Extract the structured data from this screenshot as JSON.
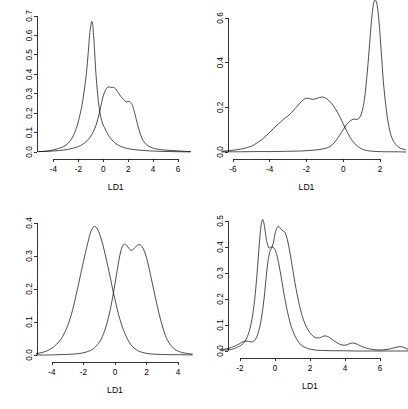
{
  "figure": {
    "title": "",
    "layout": "2x2 grid of kernel density plots",
    "background_color": "#ffffff",
    "line_color": "#000000"
  },
  "chart_data": [
    {
      "type": "line",
      "panel": "top-left",
      "title": "",
      "xlabel": "LD1",
      "ylabel": "",
      "xlim": [
        -5.2,
        7.0
      ],
      "ylim": [
        0.0,
        0.72
      ],
      "xticks": [
        -4,
        -2,
        0,
        2,
        4,
        6
      ],
      "xtick_labels": [
        "-4",
        "-2",
        "0",
        "2",
        "4",
        "6"
      ],
      "yticks": [
        0.0,
        0.1,
        0.2,
        0.3,
        0.4,
        0.5,
        0.6,
        0.7
      ],
      "ytick_labels": [
        "0.0",
        "0.1",
        "0.2",
        "0.3",
        "0.4",
        "0.5",
        "0.6",
        "0.7"
      ],
      "grid": false,
      "legend": "none",
      "series": [
        {
          "name": "group-1-narrow-peak",
          "x": [
            -5.2,
            -4.6,
            -4.2,
            -3.8,
            -3.4,
            -3.0,
            -2.7,
            -2.4,
            -2.1,
            -1.9,
            -1.7,
            -1.5,
            -1.35,
            -1.2,
            -1.1,
            -1.0,
            -0.92,
            -0.85,
            -0.78,
            -0.7,
            -0.6,
            -0.5,
            -0.4,
            -0.3,
            -0.2,
            -0.05,
            0.1,
            0.3,
            0.5,
            0.8,
            1.2,
            1.7,
            2.2,
            2.8,
            3.4,
            4.0,
            4.8,
            5.6,
            6.4,
            7.0
          ],
          "y": [
            0.002,
            0.004,
            0.008,
            0.014,
            0.022,
            0.035,
            0.055,
            0.085,
            0.135,
            0.185,
            0.245,
            0.33,
            0.41,
            0.52,
            0.6,
            0.655,
            0.672,
            0.655,
            0.6,
            0.52,
            0.41,
            0.33,
            0.265,
            0.215,
            0.18,
            0.145,
            0.125,
            0.1,
            0.078,
            0.055,
            0.035,
            0.022,
            0.015,
            0.01,
            0.007,
            0.005,
            0.003,
            0.002,
            0.001,
            0.001
          ]
        },
        {
          "name": "group-2-broad-peak",
          "x": [
            -5.2,
            -4.4,
            -3.8,
            -3.2,
            -2.8,
            -2.4,
            -2.0,
            -1.7,
            -1.4,
            -1.2,
            -1.0,
            -0.8,
            -0.6,
            -0.45,
            -0.3,
            -0.15,
            0.0,
            0.15,
            0.3,
            0.45,
            0.6,
            0.75,
            0.9,
            1.05,
            1.2,
            1.4,
            1.6,
            1.75,
            1.9,
            2.05,
            2.2,
            2.35,
            2.5,
            2.65,
            2.8,
            2.95,
            3.1,
            3.3,
            3.5,
            3.8,
            4.1,
            4.4,
            4.8,
            5.2,
            5.7,
            6.2,
            6.6,
            7.0
          ],
          "y": [
            0.002,
            0.004,
            0.006,
            0.01,
            0.014,
            0.02,
            0.028,
            0.038,
            0.052,
            0.065,
            0.082,
            0.105,
            0.135,
            0.168,
            0.205,
            0.25,
            0.29,
            0.315,
            0.33,
            0.336,
            0.332,
            0.333,
            0.33,
            0.32,
            0.305,
            0.287,
            0.272,
            0.262,
            0.258,
            0.26,
            0.255,
            0.238,
            0.205,
            0.168,
            0.13,
            0.098,
            0.072,
            0.05,
            0.036,
            0.025,
            0.018,
            0.014,
            0.011,
            0.009,
            0.007,
            0.005,
            0.003,
            0.002
          ]
        }
      ]
    },
    {
      "type": "line",
      "panel": "top-right",
      "title": "",
      "xlabel": "LD1",
      "ylabel": "",
      "xlim": [
        -6.6,
        3.4
      ],
      "ylim": [
        0.0,
        0.7
      ],
      "xticks": [
        -6,
        -4,
        -2,
        0,
        2
      ],
      "xtick_labels": [
        "-6",
        "-4",
        "-2",
        "0",
        "2"
      ],
      "yticks": [
        0.0,
        0.2,
        0.4,
        0.6
      ],
      "ytick_labels": [
        "0.0",
        "0.2",
        "0.4",
        "0.6"
      ],
      "grid": false,
      "legend": "none",
      "series": [
        {
          "name": "group-1-broad-left",
          "x": [
            -6.6,
            -6.2,
            -5.8,
            -5.4,
            -5.0,
            -4.7,
            -4.4,
            -4.1,
            -3.8,
            -3.5,
            -3.2,
            -3.0,
            -2.8,
            -2.6,
            -2.4,
            -2.2,
            -2.0,
            -1.8,
            -1.6,
            -1.4,
            -1.2,
            -1.0,
            -0.8,
            -0.6,
            -0.4,
            -0.2,
            0.0,
            0.2,
            0.4,
            0.6,
            0.8,
            1.0,
            1.2,
            1.5,
            1.9,
            2.3,
            2.8,
            3.4
          ],
          "y": [
            0.004,
            0.006,
            0.01,
            0.016,
            0.026,
            0.04,
            0.058,
            0.08,
            0.105,
            0.128,
            0.15,
            0.162,
            0.178,
            0.196,
            0.215,
            0.232,
            0.241,
            0.238,
            0.236,
            0.241,
            0.246,
            0.243,
            0.232,
            0.214,
            0.19,
            0.16,
            0.126,
            0.092,
            0.062,
            0.04,
            0.024,
            0.014,
            0.008,
            0.004,
            0.002,
            0.001,
            0.001,
            0.0
          ]
        },
        {
          "name": "group-2-narrow-right",
          "x": [
            -6.6,
            -5.6,
            -4.6,
            -3.8,
            -3.2,
            -2.6,
            -2.2,
            -1.8,
            -1.4,
            -1.0,
            -0.7,
            -0.45,
            -0.2,
            0.0,
            0.2,
            0.4,
            0.55,
            0.7,
            0.85,
            1.0,
            1.15,
            1.3,
            1.45,
            1.55,
            1.65,
            1.75,
            1.85,
            1.95,
            2.05,
            2.2,
            2.4,
            2.6,
            2.8,
            3.0,
            3.2,
            3.4
          ],
          "y": [
            0.001,
            0.001,
            0.002,
            0.002,
            0.003,
            0.004,
            0.005,
            0.007,
            0.01,
            0.016,
            0.026,
            0.045,
            0.075,
            0.1,
            0.125,
            0.14,
            0.147,
            0.146,
            0.15,
            0.175,
            0.235,
            0.35,
            0.5,
            0.6,
            0.665,
            0.68,
            0.655,
            0.58,
            0.47,
            0.3,
            0.155,
            0.075,
            0.04,
            0.022,
            0.014,
            0.01
          ]
        }
      ]
    },
    {
      "type": "line",
      "panel": "bottom-left",
      "title": "",
      "xlabel": "LD1",
      "ylabel": "",
      "xlim": [
        -5.0,
        4.9
      ],
      "ylim": [
        0.0,
        0.41
      ],
      "xticks": [
        -4,
        -2,
        0,
        2,
        4
      ],
      "xtick_labels": [
        "-4",
        "-2",
        "0",
        "2",
        "4"
      ],
      "yticks": [
        0.0,
        0.1,
        0.2,
        0.3,
        0.4
      ],
      "ytick_labels": [
        "0.0",
        "0.1",
        "0.2",
        "0.3",
        "0.4"
      ],
      "grid": false,
      "legend": "none",
      "series": [
        {
          "name": "group-1-left-mode",
          "x": [
            -5.0,
            -4.6,
            -4.3,
            -4.0,
            -3.7,
            -3.4,
            -3.1,
            -2.9,
            -2.7,
            -2.5,
            -2.3,
            -2.1,
            -1.9,
            -1.7,
            -1.55,
            -1.4,
            -1.3,
            -1.2,
            -1.05,
            -0.9,
            -0.75,
            -0.6,
            -0.45,
            -0.3,
            -0.15,
            0.0,
            0.15,
            0.3,
            0.5,
            0.7,
            0.9,
            1.1,
            1.35,
            1.6,
            1.9,
            2.3,
            2.8,
            3.4,
            4.1,
            4.9
          ],
          "y": [
            0.004,
            0.008,
            0.013,
            0.021,
            0.033,
            0.05,
            0.078,
            0.103,
            0.135,
            0.175,
            0.218,
            0.262,
            0.305,
            0.345,
            0.372,
            0.386,
            0.39,
            0.387,
            0.375,
            0.355,
            0.33,
            0.3,
            0.268,
            0.235,
            0.2,
            0.168,
            0.137,
            0.11,
            0.08,
            0.057,
            0.039,
            0.026,
            0.016,
            0.01,
            0.006,
            0.003,
            0.002,
            0.001,
            0.001,
            0.0
          ]
        },
        {
          "name": "group-2-right-mode",
          "x": [
            -5.0,
            -4.2,
            -3.6,
            -3.0,
            -2.6,
            -2.2,
            -1.9,
            -1.6,
            -1.35,
            -1.1,
            -0.9,
            -0.7,
            -0.5,
            -0.3,
            -0.1,
            0.1,
            0.3,
            0.45,
            0.6,
            0.75,
            0.9,
            1.05,
            1.2,
            1.35,
            1.5,
            1.65,
            1.8,
            1.95,
            2.1,
            2.3,
            2.5,
            2.7,
            2.9,
            3.1,
            3.3,
            3.55,
            3.8,
            4.1,
            4.4,
            4.9
          ],
          "y": [
            0.0,
            0.0,
            0.001,
            0.002,
            0.003,
            0.005,
            0.008,
            0.013,
            0.02,
            0.032,
            0.046,
            0.068,
            0.098,
            0.138,
            0.188,
            0.245,
            0.3,
            0.327,
            0.336,
            0.332,
            0.322,
            0.317,
            0.322,
            0.33,
            0.334,
            0.332,
            0.322,
            0.303,
            0.276,
            0.233,
            0.188,
            0.145,
            0.106,
            0.073,
            0.048,
            0.029,
            0.017,
            0.01,
            0.006,
            0.003
          ]
        }
      ]
    },
    {
      "type": "line",
      "panel": "bottom-right",
      "title": "",
      "xlabel": "LD1",
      "ylabel": "",
      "xlim": [
        -3.1,
        7.6
      ],
      "ylim": [
        0.0,
        0.52
      ],
      "xticks": [
        -2,
        0,
        2,
        4,
        6
      ],
      "xtick_labels": [
        "-2",
        "0",
        "2",
        "4",
        "6"
      ],
      "yticks": [
        0.0,
        0.1,
        0.2,
        0.3,
        0.4,
        0.5
      ],
      "ytick_labels": [
        "0.0",
        "0.1",
        "0.2",
        "0.3",
        "0.4",
        "0.5"
      ],
      "grid": false,
      "legend": "none",
      "series": [
        {
          "name": "group-1-sharp-peak",
          "x": [
            -3.1,
            -2.8,
            -2.5,
            -2.3,
            -2.1,
            -1.95,
            -1.8,
            -1.65,
            -1.5,
            -1.35,
            -1.2,
            -1.1,
            -1.0,
            -0.9,
            -0.8,
            -0.72,
            -0.65,
            -0.58,
            -0.5,
            -0.42,
            -0.35,
            -0.28,
            -0.2,
            -0.1,
            0.0,
            0.1,
            0.2,
            0.3,
            0.4,
            0.5,
            0.6,
            0.7,
            0.85,
            1.0,
            1.2,
            1.4,
            1.6,
            1.85,
            2.1,
            2.4,
            2.8,
            3.3,
            3.9,
            4.6,
            5.4,
            6.3,
            7.0,
            7.6
          ],
          "y": [
            0.002,
            0.004,
            0.006,
            0.01,
            0.016,
            0.022,
            0.03,
            0.045,
            0.07,
            0.11,
            0.175,
            0.24,
            0.32,
            0.41,
            0.48,
            0.505,
            0.497,
            0.47,
            0.432,
            0.408,
            0.396,
            0.398,
            0.4,
            0.398,
            0.39,
            0.37,
            0.34,
            0.305,
            0.265,
            0.225,
            0.188,
            0.155,
            0.112,
            0.08,
            0.05,
            0.03,
            0.018,
            0.01,
            0.006,
            0.003,
            0.002,
            0.001,
            0.001,
            0.0,
            0.0,
            0.0,
            0.0,
            0.0
          ]
        },
        {
          "name": "group-2-broad-with-bumps",
          "x": [
            -3.1,
            -2.8,
            -2.5,
            -2.25,
            -2.05,
            -1.9,
            -1.75,
            -1.6,
            -1.45,
            -1.3,
            -1.15,
            -1.0,
            -0.85,
            -0.7,
            -0.58,
            -0.48,
            -0.38,
            -0.28,
            -0.18,
            -0.08,
            0.0,
            0.1,
            0.2,
            0.32,
            0.45,
            0.58,
            0.7,
            0.85,
            1.0,
            1.2,
            1.4,
            1.6,
            1.8,
            2.0,
            2.2,
            2.4,
            2.6,
            2.8,
            3.0,
            3.2,
            3.4,
            3.7,
            4.0,
            4.25,
            4.45,
            4.7,
            5.0,
            5.4,
            5.9,
            6.4,
            6.8,
            7.1,
            7.35,
            7.6
          ],
          "y": [
            0.004,
            0.008,
            0.014,
            0.02,
            0.027,
            0.033,
            0.037,
            0.038,
            0.036,
            0.035,
            0.042,
            0.062,
            0.1,
            0.16,
            0.23,
            0.3,
            0.355,
            0.385,
            0.398,
            0.42,
            0.45,
            0.472,
            0.48,
            0.47,
            0.462,
            0.455,
            0.43,
            0.38,
            0.32,
            0.24,
            0.175,
            0.125,
            0.092,
            0.07,
            0.056,
            0.05,
            0.052,
            0.058,
            0.056,
            0.048,
            0.038,
            0.026,
            0.022,
            0.028,
            0.031,
            0.026,
            0.016,
            0.008,
            0.004,
            0.006,
            0.012,
            0.017,
            0.014,
            0.006
          ]
        }
      ]
    }
  ]
}
